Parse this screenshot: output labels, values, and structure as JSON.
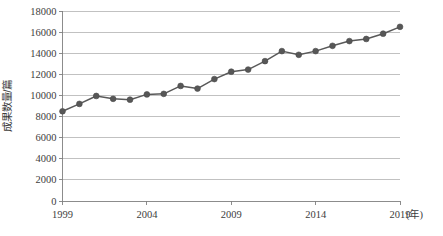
{
  "chart_data": {
    "type": "line",
    "title": "",
    "subtitle": "",
    "xlabel": "年",
    "ylabel": "成果数量/篇",
    "x_unit_label": "(年)",
    "xlim": [
      1999,
      2019
    ],
    "ylim": [
      0,
      18000
    ],
    "y_tick_step": 2000,
    "grid": true,
    "legend": false,
    "legend_position": "none",
    "series_color": "#595959",
    "marker_color": "#575757",
    "gridline_color": "#a6a6a6",
    "axis_color": "#7f7f7f",
    "background_color": "#ffffff",
    "y_ticks": [
      0,
      2000,
      4000,
      6000,
      8000,
      10000,
      12000,
      14000,
      16000,
      18000
    ],
    "y_tick_labels": [
      "0",
      "2000",
      "4000",
      "6000",
      "8000",
      "10000",
      "12000",
      "14000",
      "16000",
      "18000"
    ],
    "x_ticks": [
      1999,
      2004,
      2009,
      2014,
      2019
    ],
    "x_tick_labels": [
      "1999",
      "2004",
      "2009",
      "2014",
      "2019"
    ],
    "x": [
      1999,
      2000,
      2001,
      2002,
      2003,
      2004,
      2005,
      2006,
      2007,
      2008,
      2009,
      2010,
      2011,
      2012,
      2013,
      2014,
      2015,
      2016,
      2017,
      2018,
      2019
    ],
    "values": [
      8500,
      9200,
      9950,
      9680,
      9600,
      10100,
      10150,
      10900,
      10650,
      11550,
      12250,
      12450,
      13250,
      14200,
      13850,
      14200,
      14700,
      15150,
      15350,
      15850,
      16500
    ],
    "series": [
      {
        "name": "成果数量",
        "values": [
          8500,
          9200,
          9950,
          9680,
          9600,
          10100,
          10150,
          10900,
          10650,
          11550,
          12250,
          12450,
          13250,
          14200,
          13850,
          14200,
          14700,
          15150,
          15350,
          15850,
          16500
        ]
      }
    ]
  }
}
